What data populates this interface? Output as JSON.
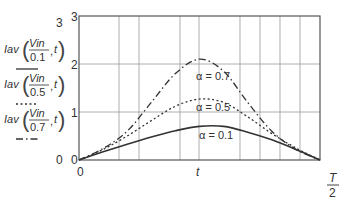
{
  "chart_data": {
    "type": "line",
    "title": "",
    "xlabel": "t",
    "xlabel_end": {
      "num": "T",
      "den": "2"
    },
    "ylabel": "",
    "x_domain": [
      0,
      1
    ],
    "ylim": [
      0,
      3
    ],
    "y_ticks_outer": [
      "0",
      "1",
      "2",
      "3"
    ],
    "y_ticks_inner": [
      "0",
      "1",
      "2",
      "3"
    ],
    "x_tick_zero": "0",
    "grid": true,
    "x_grid": [
      0.166,
      0.249,
      0.419,
      0.498,
      0.668,
      0.751,
      0.834,
      0.917
    ],
    "legend_position": "left",
    "legend": [
      {
        "func": "Iav",
        "num": "Vin",
        "den": "0.1",
        "arg": "t",
        "style": "solid"
      },
      {
        "func": "Iav",
        "num": "Vin",
        "den": "0.5",
        "arg": "t",
        "style": "dotted"
      },
      {
        "func": "Iav",
        "num": "Vin",
        "den": "0.7",
        "arg": "t",
        "style": "dashdot"
      }
    ],
    "series": [
      {
        "name": "alpha=0.1",
        "label": "α = 0.1",
        "style": "solid",
        "x": [
          0,
          0.1,
          0.2,
          0.3,
          0.4,
          0.5,
          0.6,
          0.7,
          0.8,
          0.9,
          1.0
        ],
        "y": [
          0,
          0.17,
          0.33,
          0.48,
          0.61,
          0.7,
          0.7,
          0.58,
          0.42,
          0.22,
          0
        ]
      },
      {
        "name": "alpha=0.5",
        "label": "α = 0.5",
        "style": "dotted",
        "x": [
          0,
          0.1,
          0.2,
          0.3,
          0.4,
          0.5,
          0.6,
          0.7,
          0.8,
          0.9,
          1.0
        ],
        "y": [
          0,
          0.22,
          0.5,
          0.82,
          1.12,
          1.27,
          1.2,
          0.9,
          0.55,
          0.25,
          0
        ]
      },
      {
        "name": "alpha=0.7",
        "label": "α = 0.7",
        "style": "dashdot",
        "x": [
          0,
          0.1,
          0.2,
          0.3,
          0.4,
          0.5,
          0.6,
          0.7,
          0.8,
          0.9,
          1.0
        ],
        "y": [
          0,
          0.24,
          0.6,
          1.2,
          1.8,
          2.1,
          1.85,
          1.2,
          0.6,
          0.22,
          0
        ]
      }
    ]
  }
}
